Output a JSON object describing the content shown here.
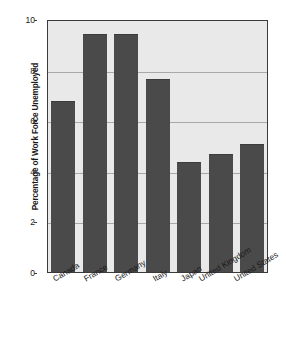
{
  "chart_data": {
    "type": "bar",
    "title": "",
    "xlabel": "",
    "ylabel": "Percentage of Work Force Unemployed",
    "categories": [
      "Canada",
      "France",
      "Germany",
      "Italy",
      "Japan",
      "United Kingdom",
      "United States"
    ],
    "values": [
      6.8,
      9.5,
      9.5,
      7.7,
      4.4,
      4.7,
      5.1
    ],
    "ylim": [
      0,
      10
    ],
    "yticks": [
      0,
      2,
      4,
      6,
      8,
      10
    ],
    "ytick_labels": [
      "0",
      "2",
      "4",
      "6",
      "8",
      "10"
    ],
    "grid": true,
    "legend": "none",
    "colors": {
      "bar_fill": "#4a4a4a",
      "plot_background": "#e9e9e9",
      "gridline": "#a8a8a8",
      "axis": "#3a3a3a",
      "text": "#1a1a1a"
    }
  }
}
